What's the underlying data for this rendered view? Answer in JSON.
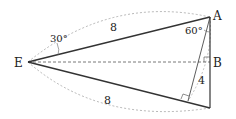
{
  "diagram": {
    "points": {
      "E": {
        "label": "E",
        "x": 28,
        "y": 62
      },
      "A": {
        "label": "A",
        "x": 210,
        "y": 17
      },
      "B": {
        "label": "B",
        "x": 210,
        "y": 62
      },
      "C": {
        "label": "",
        "x": 210,
        "y": 108
      },
      "H": {
        "label": "",
        "x": 188,
        "y": 101
      }
    },
    "labels": {
      "angle_E": "30°",
      "angle_A": "60°",
      "side_EA": "8",
      "side_EC": "8",
      "side_perp": "4"
    },
    "colors": {
      "solid": "#333333",
      "dashed": "#888888"
    }
  }
}
